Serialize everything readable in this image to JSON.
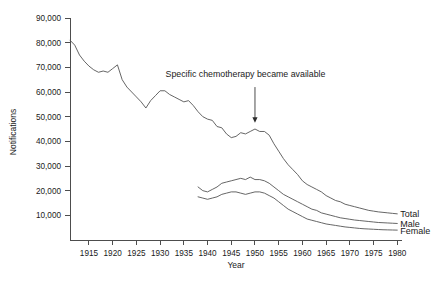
{
  "chart_data": {
    "type": "line",
    "title": "",
    "xlabel": "Year",
    "ylabel": "Notifications",
    "xlim": [
      1911,
      1981
    ],
    "ylim": [
      0,
      90000
    ],
    "grid": false,
    "legend_position": "right-inline-end-of-line",
    "x_ticks": [
      1915,
      1920,
      1925,
      1930,
      1935,
      1940,
      1945,
      1950,
      1955,
      1960,
      1965,
      1970,
      1975,
      1980
    ],
    "x_tick_labels": [
      "1915",
      "1920",
      "1925",
      "1930",
      "1935",
      "1940",
      "1945",
      "1950",
      "1955",
      "1960",
      "1965",
      "1970",
      "1975",
      "1980"
    ],
    "y_ticks": [
      10000,
      20000,
      30000,
      40000,
      50000,
      60000,
      70000,
      80000,
      90000
    ],
    "y_tick_labels": [
      "10,000",
      "20,000",
      "30,000",
      "40,000",
      "50,000",
      "60,000",
      "70,000",
      "80,000",
      "90,000"
    ],
    "annotations": [
      {
        "text": "Specific chemotherapy became available",
        "text_x": 1948,
        "text_y": 66000,
        "arrow_from_year": 1950,
        "arrow_from_value": 62000,
        "arrow_to_year": 1950,
        "arrow_to_value": 47500
      }
    ],
    "series": [
      {
        "name": "Total",
        "label": "Total",
        "color": "#555555",
        "x": [
          1911,
          1912,
          1913,
          1914,
          1915,
          1916,
          1917,
          1918,
          1919,
          1920,
          1921,
          1922,
          1923,
          1924,
          1925,
          1926,
          1927,
          1928,
          1929,
          1930,
          1931,
          1932,
          1933,
          1934,
          1935,
          1936,
          1937,
          1938,
          1939,
          1940,
          1941,
          1942,
          1943,
          1944,
          1945,
          1946,
          1947,
          1948,
          1949,
          1950,
          1951,
          1952,
          1953,
          1954,
          1955,
          1956,
          1957,
          1958,
          1959,
          1960,
          1961,
          1962,
          1963,
          1964,
          1965,
          1966,
          1967,
          1968,
          1969,
          1970,
          1971,
          1972,
          1973,
          1974,
          1975,
          1976,
          1977,
          1978,
          1979,
          1980
        ],
        "values": [
          81000,
          79000,
          75000,
          72500,
          70500,
          69000,
          68000,
          68500,
          68000,
          69500,
          71000,
          65000,
          62000,
          60000,
          58000,
          56000,
          53500,
          56500,
          58500,
          60500,
          60500,
          59000,
          58000,
          57000,
          56000,
          56500,
          54500,
          52000,
          50000,
          49000,
          48500,
          46000,
          45500,
          43000,
          41500,
          42000,
          43500,
          43000,
          44000,
          45000,
          44000,
          44000,
          42500,
          39000,
          36000,
          33000,
          30500,
          28500,
          26500,
          24000,
          22500,
          21500,
          20500,
          19500,
          18000,
          17000,
          16000,
          15500,
          14500,
          14000,
          13500,
          13000,
          12500,
          12000,
          11700,
          11400,
          11200,
          11000,
          10800,
          10600
        ]
      },
      {
        "name": "Male",
        "label": "Male",
        "color": "#555555",
        "x": [
          1938,
          1939,
          1940,
          1941,
          1942,
          1943,
          1944,
          1945,
          1946,
          1947,
          1948,
          1949,
          1950,
          1951,
          1952,
          1953,
          1954,
          1955,
          1956,
          1957,
          1958,
          1959,
          1960,
          1961,
          1962,
          1963,
          1964,
          1965,
          1966,
          1967,
          1968,
          1969,
          1970,
          1971,
          1972,
          1973,
          1974,
          1975,
          1976,
          1977,
          1978,
          1979,
          1980
        ],
        "values": [
          21500,
          20000,
          19500,
          20500,
          21500,
          23000,
          23500,
          24000,
          24500,
          25000,
          24500,
          25500,
          24500,
          24500,
          24000,
          23000,
          21500,
          20000,
          18500,
          17500,
          16500,
          15500,
          14500,
          13500,
          12500,
          12000,
          11000,
          10500,
          10000,
          9500,
          9000,
          8700,
          8400,
          8100,
          7900,
          7700,
          7500,
          7300,
          7100,
          7000,
          6900,
          6800,
          6700
        ]
      },
      {
        "name": "Female",
        "label": "Female",
        "color": "#555555",
        "x": [
          1938,
          1939,
          1940,
          1941,
          1942,
          1943,
          1944,
          1945,
          1946,
          1947,
          1948,
          1949,
          1950,
          1951,
          1952,
          1953,
          1954,
          1955,
          1956,
          1957,
          1958,
          1959,
          1960,
          1961,
          1962,
          1963,
          1964,
          1965,
          1966,
          1967,
          1968,
          1969,
          1970,
          1971,
          1972,
          1973,
          1974,
          1975,
          1976,
          1977,
          1978,
          1979,
          1980
        ],
        "values": [
          17500,
          17000,
          16500,
          17000,
          17500,
          18500,
          19000,
          19500,
          19500,
          19000,
          18500,
          19000,
          19500,
          19500,
          19000,
          18000,
          17000,
          15500,
          14000,
          12500,
          11500,
          10500,
          9500,
          8500,
          8000,
          7500,
          7000,
          6500,
          6200,
          5900,
          5600,
          5300,
          5100,
          4900,
          4700,
          4550,
          4450,
          4350,
          4250,
          4150,
          4100,
          4050,
          4000
        ]
      }
    ]
  }
}
